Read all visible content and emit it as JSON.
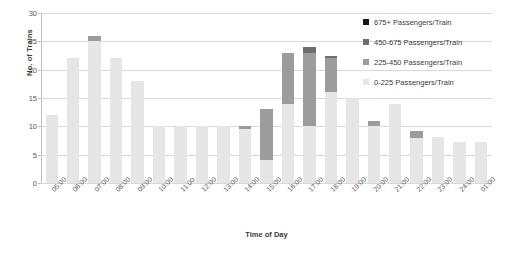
{
  "chart_data": {
    "type": "bar",
    "stacked": true,
    "title": "",
    "xlabel": "Time of Day",
    "ylabel": "No. of Trains",
    "ylim": [
      0,
      30
    ],
    "yticks": [
      0,
      5,
      10,
      15,
      20,
      25,
      30
    ],
    "grid": true,
    "legend_position": "right",
    "categories": [
      "05:00",
      "06:00",
      "07:00",
      "08:00",
      "09:00",
      "10:00",
      "11:00",
      "12:00",
      "13:00",
      "14:00",
      "15:00",
      "16:00",
      "17:00",
      "18:00",
      "19:00",
      "20:00",
      "21:00",
      "22:00",
      "23:00",
      "24:00",
      "01:00"
    ],
    "series": [
      {
        "name": "0-225 Passengers/Train",
        "color": "#e6e6e6",
        "values": [
          12,
          22,
          25,
          22,
          18,
          10,
          10,
          10,
          10,
          9.5,
          4,
          14,
          10,
          16,
          15,
          10,
          14,
          8,
          8.2,
          7.2,
          7.2
        ]
      },
      {
        "name": "225-450 Passengers/Train",
        "color": "#9c9c9c",
        "values": [
          0,
          0,
          1,
          0,
          0,
          0,
          0,
          0,
          0,
          0.5,
          9,
          9,
          13,
          6,
          0,
          1,
          0,
          1.2,
          0,
          0,
          0
        ]
      },
      {
        "name": "450-675 Passengers/Train",
        "color": "#6e6e6e",
        "values": [
          0,
          0,
          0,
          0,
          0,
          0,
          0,
          0,
          0,
          0,
          0,
          0,
          1,
          0.4,
          0,
          0,
          0,
          0,
          0,
          0,
          0
        ]
      },
      {
        "name": "675+ Passengers/Train",
        "color": "#1a1a1a",
        "values": [
          0,
          0,
          0,
          0,
          0,
          0,
          0,
          0,
          0,
          0,
          0,
          0,
          0,
          0,
          0,
          0,
          0,
          0,
          0,
          0,
          0
        ]
      }
    ],
    "totals": [
      12,
      22,
      26,
      22,
      18,
      10,
      10,
      10,
      10,
      10,
      13,
      23,
      24,
      22.4,
      15,
      11,
      14,
      9.2,
      8.2,
      7.2,
      7.2
    ]
  },
  "legend": {
    "items": [
      {
        "label": "675+ Passengers/Train",
        "color": "#1a1a1a"
      },
      {
        "label": "450-675 Passengers/Train",
        "color": "#6e6e6e"
      },
      {
        "label": "225-450 Passengers/Train",
        "color": "#9c9c9c"
      },
      {
        "label": "0-225 Passengers/Train",
        "color": "#e6e6e6"
      }
    ]
  },
  "axes": {
    "y_title": "No. of Trains",
    "x_title": "Time of Day"
  }
}
